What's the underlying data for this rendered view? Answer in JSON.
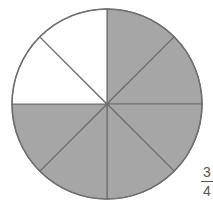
{
  "figure": {
    "type": "fraction-circle",
    "total_sectors": 8,
    "shaded_sectors": 6,
    "unshaded_sectors": 2,
    "colors": {
      "shaded": "#a6a6a6",
      "unshaded": "#ffffff",
      "stroke": "#6e6e6e"
    },
    "sectors": [
      {
        "index": 0,
        "shaded": true
      },
      {
        "index": 1,
        "shaded": true
      },
      {
        "index": 2,
        "shaded": true
      },
      {
        "index": 3,
        "shaded": true
      },
      {
        "index": 4,
        "shaded": true
      },
      {
        "index": 5,
        "shaded": true
      },
      {
        "index": 6,
        "shaded": false
      },
      {
        "index": 7,
        "shaded": false
      }
    ]
  },
  "label": {
    "numerator": "3",
    "denominator": "4"
  }
}
